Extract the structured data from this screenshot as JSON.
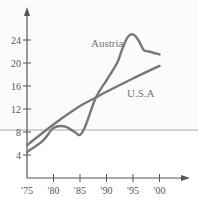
{
  "chart_data": {
    "type": "line",
    "title": "",
    "xlabel": "",
    "ylabel": "",
    "x_tick_labels": [
      "'75",
      "'80",
      "'85",
      "'90",
      "'95",
      "'00"
    ],
    "y_tick_labels": [
      "4",
      "8",
      "12",
      "16",
      "20",
      "24"
    ],
    "xlim": [
      1975,
      2002
    ],
    "ylim": [
      0,
      27
    ],
    "grid": false,
    "legend": "inline labels",
    "series": [
      {
        "name": "Austria",
        "label": "Austria",
        "x": [
          1975,
          1978,
          1980,
          1982,
          1984,
          1985,
          1986,
          1988,
          1990,
          1992,
          1993,
          1994,
          1995,
          1996,
          1997,
          1998,
          2000
        ],
        "values": [
          4.5,
          6.5,
          8.7,
          9.0,
          8.0,
          7.5,
          9.0,
          14.0,
          17.0,
          20.0,
          22.5,
          24.5,
          25.0,
          24.0,
          22.3,
          22.0,
          21.5
        ]
      },
      {
        "name": "U.S.A",
        "label": "U.S.A",
        "x": [
          1975,
          1980,
          1985,
          1988,
          1990,
          1995,
          2000
        ],
        "values": [
          5.7,
          9.3,
          12.5,
          14.0,
          15.0,
          17.3,
          19.5
        ]
      }
    ],
    "colors": {
      "axis": "#555555",
      "line": "#777777",
      "label_text": "#777777"
    }
  }
}
